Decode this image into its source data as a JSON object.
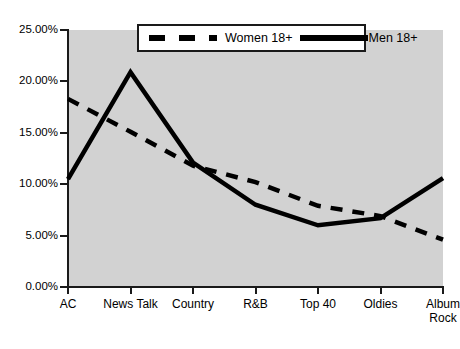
{
  "chart_data": {
    "type": "line",
    "title": "",
    "xlabel": "",
    "ylabel": "",
    "categories": [
      "AC",
      "News Talk",
      "Country",
      "R&B",
      "Top 40",
      "Oldies",
      "Album Rock"
    ],
    "series": [
      {
        "name": "Women 18+",
        "style": "dashed",
        "color": "#000000",
        "values": [
          18.3,
          15.1,
          11.8,
          10.2,
          7.9,
          6.9,
          4.6
        ]
      },
      {
        "name": "Men 18+",
        "style": "solid",
        "color": "#000000",
        "values": [
          10.5,
          20.9,
          12.1,
          8.0,
          6.0,
          6.7,
          10.6
        ]
      }
    ],
    "ylim": [
      0,
      25
    ],
    "ytick_values": [
      25,
      20,
      15,
      10,
      5,
      0
    ],
    "ytick_labels": [
      "25.00%",
      "20.00%",
      "15.00%",
      "10.00%",
      "5.00%",
      "0.00%"
    ],
    "grid": false,
    "legend_position": "top-center",
    "plot_background": "#d2d2d2",
    "axis_color": "#1a1a1a"
  },
  "legend": {
    "women_label": "Women 18+",
    "men_label": "Men 18+"
  }
}
